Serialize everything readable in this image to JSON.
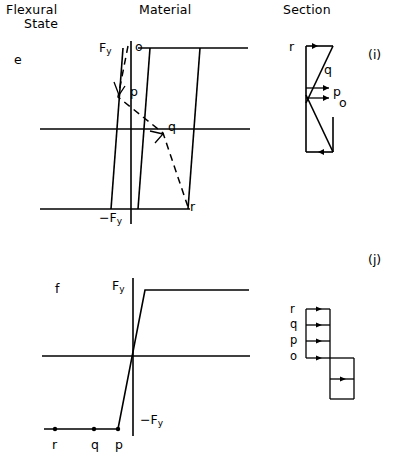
{
  "headers": {
    "col1_line1": "Flexural",
    "col1_line2": "State",
    "col2": "Material",
    "col3": "Section"
  },
  "rows": [
    {
      "state_label": "e",
      "case_label": "(i)",
      "material": {
        "y_axis_top_label": "F",
        "y_axis_top_sub": "y",
        "y_axis_bottom_label": "−F",
        "y_axis_bottom_sub": "y",
        "point_labels": [
          "o",
          "p",
          "q",
          "r"
        ]
      },
      "section": {
        "point_labels": [
          "r",
          "q",
          "p",
          "o"
        ]
      }
    },
    {
      "state_label": "f",
      "case_label": "(j)",
      "material": {
        "y_axis_top_label": "F",
        "y_axis_top_sub": "y",
        "y_axis_bottom_label": "−F",
        "y_axis_bottom_sub": "y",
        "axis_point_labels": [
          "r",
          "q",
          "p"
        ]
      },
      "section": {
        "point_labels": [
          "r",
          "q",
          "p",
          "o"
        ]
      }
    }
  ],
  "colors": {
    "ink": "#000000",
    "paper": "#ffffff"
  }
}
